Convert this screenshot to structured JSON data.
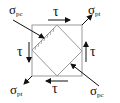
{
  "diagram": {
    "title": "",
    "colors": {
      "frame": "#9a9a9a",
      "arrow": "#111111",
      "hatch": "#8a8a8a"
    },
    "labels": {
      "sigma_pc_top_left": {
        "symbol": "σ",
        "sub": "pc"
      },
      "sigma_pt_top_right": {
        "symbol": "σ",
        "sub": "pt"
      },
      "sigma_pt_bottom_left": {
        "symbol": "σ",
        "sub": "pt"
      },
      "sigma_pc_bottom_right": {
        "symbol": "σ",
        "sub": "pc"
      },
      "tau_top": "τ",
      "tau_bottom": "τ",
      "tau_left": "τ",
      "tau_right": "τ"
    }
  }
}
